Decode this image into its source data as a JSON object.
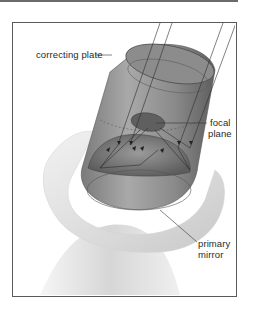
{
  "diagram": {
    "labels": {
      "correcting_plate": "correcting plate",
      "focal_plane_line1": "focal",
      "focal_plane_line2": "plane",
      "primary_mirror_line1": "primary",
      "primary_mirror_line2": "mirror"
    },
    "colors": {
      "frame_border": "#5a5a5a",
      "tube_dark": "#6e6e6e",
      "tube_light": "#b8b8b8",
      "mount": "#e4e4e4",
      "leader_line": "#333333",
      "text": "#2a2a2a"
    }
  }
}
